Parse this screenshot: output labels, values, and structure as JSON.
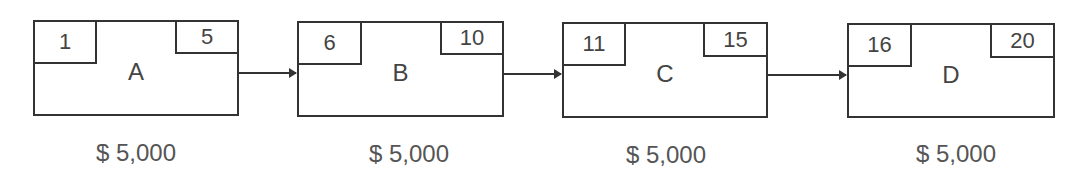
{
  "diagram": {
    "type": "activity-network",
    "nodes": [
      {
        "id": "A",
        "label": "A",
        "start": "1",
        "end": "5",
        "cost": "$ 5,000"
      },
      {
        "id": "B",
        "label": "B",
        "start": "6",
        "end": "10",
        "cost": "$ 5,000"
      },
      {
        "id": "C",
        "label": "C",
        "start": "11",
        "end": "15",
        "cost": "$ 5,000"
      },
      {
        "id": "D",
        "label": "D",
        "start": "16",
        "end": "20",
        "cost": "$ 5,000"
      }
    ],
    "edges": [
      {
        "from": "A",
        "to": "B"
      },
      {
        "from": "B",
        "to": "C"
      },
      {
        "from": "C",
        "to": "D"
      }
    ]
  }
}
